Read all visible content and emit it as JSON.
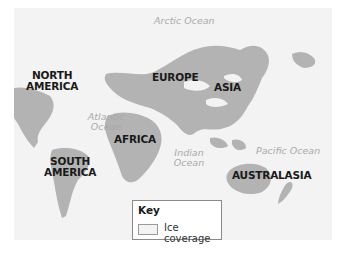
{
  "map": {
    "title": "Ice coverage world map",
    "continents": [
      {
        "label": "NORTH\nAMERICA",
        "line1": "NORTH",
        "line2": "AMERICA"
      },
      {
        "label": "EUROPE"
      },
      {
        "label": "ASIA"
      },
      {
        "label": "AFRICA"
      },
      {
        "label": "SOUTH\nAMERICA",
        "line1": "SOUTH",
        "line2": "AMERICA"
      },
      {
        "label": "AUSTRALASIA"
      }
    ],
    "oceans": [
      {
        "label": "Arctic Ocean"
      },
      {
        "label": "Atlantic",
        "line2": "Ocean"
      },
      {
        "label": "Indian",
        "line2": "Ocean"
      },
      {
        "label": "Pacific Ocean"
      }
    ],
    "colors": {
      "land": "#b3b3b3",
      "ice": "#f3f3f3",
      "ocean": "#ffffff",
      "label": "#1a1a1a",
      "ocean_label": "#a9a9a9"
    }
  },
  "key": {
    "title": "Key",
    "items": [
      {
        "swatch_color": "#f3f3f3",
        "label": "Ice coverage"
      }
    ]
  }
}
